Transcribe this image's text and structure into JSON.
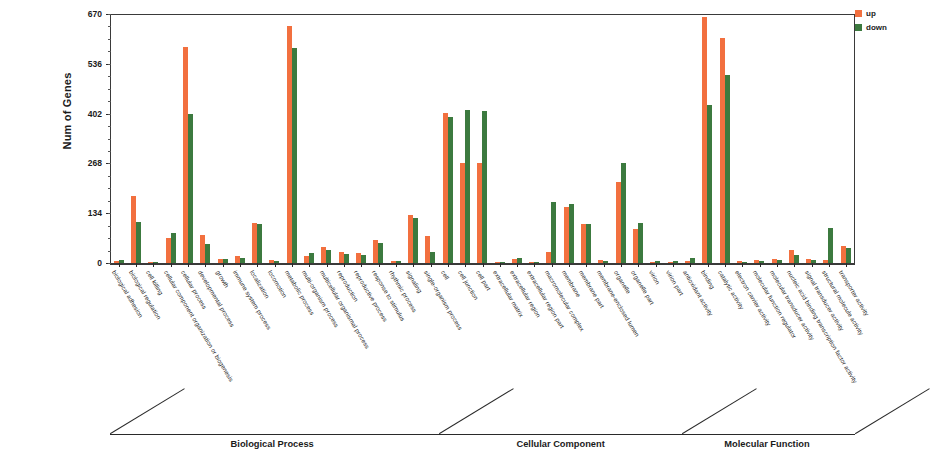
{
  "chart_data": {
    "type": "bar",
    "title": "",
    "xlabel": "",
    "ylabel": "Num of Genes",
    "ylim": [
      0,
      670
    ],
    "yticks": [
      0,
      134,
      268,
      402,
      536,
      670
    ],
    "grid": false,
    "legend_position": "top-right",
    "series": [
      {
        "name": "up",
        "color": "#f2703f"
      },
      {
        "name": "down",
        "color": "#3c7a3f"
      }
    ],
    "groups": [
      {
        "name": "Biological Process",
        "categories": [
          "biological adhesion",
          "biological regulation",
          "cell killing",
          "cellular component organization or biogenesis",
          "cellular process",
          "developmental process",
          "growth",
          "immune system process",
          "localization",
          "locomotion",
          "metabolic process",
          "multi-organism process",
          "multicellular organismal process",
          "reproduction",
          "reproductive process",
          "response to stimulus",
          "rhythmic process",
          "signaling",
          "single-organism process"
        ],
        "up": [
          6,
          180,
          4,
          68,
          580,
          75,
          10,
          20,
          108,
          8,
          638,
          20,
          42,
          30,
          28,
          62,
          5,
          130,
          72
        ],
        "down": [
          8,
          110,
          2,
          82,
          402,
          50,
          12,
          14,
          104,
          6,
          578,
          26,
          36,
          24,
          22,
          54,
          6,
          122,
          30
        ]
      },
      {
        "name": "Cellular Component",
        "categories": [
          "cell",
          "cell junction",
          "cell part",
          "extracellular matrix",
          "extracellular region",
          "extracellular region part",
          "macromolecular complex",
          "membrane",
          "membrane part",
          "membrane-enclosed lumen",
          "organelle",
          "organelle part",
          "virion",
          "virion part"
        ],
        "up": [
          405,
          270,
          268,
          4,
          10,
          3,
          30,
          152,
          105,
          8,
          218,
          92,
          4,
          4
        ],
        "down": [
          392,
          412,
          410,
          3,
          14,
          4,
          163,
          158,
          105,
          6,
          268,
          108,
          5,
          5
        ]
      },
      {
        "name": "Molecular Function",
        "categories": [
          "antioxidant activity",
          "binding",
          "catalytic activity",
          "electron carrier activity",
          "molecular function regulator",
          "molecular transducer activity",
          "nucleic acid binding transcription factor activity",
          "signal transducer activity",
          "structural molecule activity",
          "transporter activity"
        ],
        "up": [
          5,
          662,
          605,
          5,
          8,
          10,
          35,
          12,
          8,
          45
        ],
        "down": [
          14,
          425,
          505,
          4,
          5,
          8,
          22,
          8,
          95,
          40
        ]
      }
    ]
  },
  "legend": {
    "items": [
      {
        "label": "up",
        "color": "#f2703f"
      },
      {
        "label": "down",
        "color": "#3c7a3f"
      }
    ]
  },
  "axis": {
    "y_title": "Num of Genes"
  }
}
